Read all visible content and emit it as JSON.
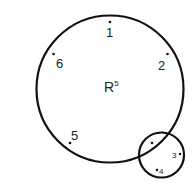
{
  "diagram": {
    "center_label": "R",
    "center_superscript": "5",
    "points": [
      {
        "label": "1"
      },
      {
        "label": "2"
      },
      {
        "label": "3"
      },
      {
        "label": "4"
      },
      {
        "label": "5"
      },
      {
        "label": "6"
      }
    ],
    "stroke_color": "#111111"
  }
}
